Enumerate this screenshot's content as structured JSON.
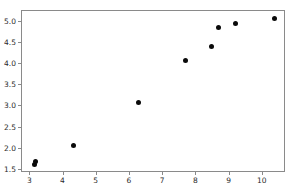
{
  "chart_data": {
    "type": "scatter",
    "title": "",
    "xlabel": "",
    "ylabel": "",
    "xlim": [
      2.75,
      10.7
    ],
    "ylim": [
      1.43,
      5.25
    ],
    "grid": false,
    "legend": null,
    "marker": {
      "shape": "circle",
      "color": "#0a0a0a",
      "size": 5
    },
    "xticks": [
      3,
      4,
      5,
      6,
      7,
      8,
      9,
      10
    ],
    "xticklabels": [
      "3",
      "4",
      "5",
      "6",
      "7",
      "8",
      "9",
      "10"
    ],
    "yticks": [
      1.5,
      2.0,
      2.5,
      3.0,
      3.5,
      4.0,
      4.5,
      5.0
    ],
    "yticklabels": [
      "1.5",
      "2.0",
      "2.5",
      "3.0",
      "3.5",
      "4.0",
      "4.5",
      "5.0"
    ],
    "x": [
      3.13,
      3.15,
      4.29,
      6.27,
      7.68,
      8.47,
      8.68,
      9.19,
      10.36
    ],
    "y": [
      1.64,
      1.71,
      2.09,
      3.1,
      4.08,
      4.41,
      4.86,
      4.95,
      5.07
    ],
    "points": [
      {
        "x": 3.13,
        "y": 1.64
      },
      {
        "x": 3.15,
        "y": 1.71
      },
      {
        "x": 4.29,
        "y": 2.09
      },
      {
        "x": 6.27,
        "y": 3.1
      },
      {
        "x": 7.68,
        "y": 4.08
      },
      {
        "x": 8.47,
        "y": 4.41
      },
      {
        "x": 8.68,
        "y": 4.86
      },
      {
        "x": 9.19,
        "y": 4.95
      },
      {
        "x": 10.36,
        "y": 5.07
      }
    ]
  },
  "figure": {
    "background_color": "#ffffff",
    "axes_edge_color": "#8a8a8a",
    "tick_label_color": "#2b2b2b"
  }
}
